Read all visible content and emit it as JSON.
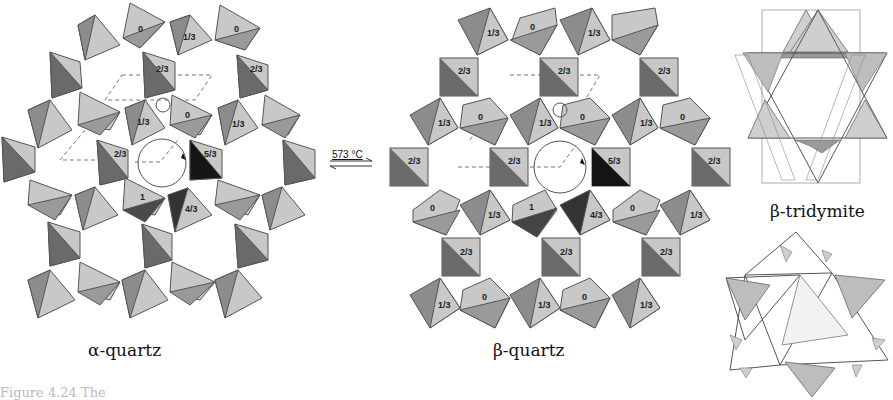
{
  "figure": {
    "panels": [
      {
        "id": "alpha-quartz",
        "caption": "α-quartz"
      },
      {
        "id": "beta-quartz",
        "caption": "β-quartz"
      },
      {
        "id": "beta-tridymite",
        "caption": "β-tridymite"
      }
    ],
    "transition": {
      "label": "573 °C",
      "arrow": "reversible-equilibrium-arrows"
    },
    "colors": {
      "light": "#c8c8c8",
      "mid": "#9a9a9a",
      "dark": "#6a6a6a",
      "black": "#151515",
      "edge": "#555555",
      "dashed": "#777777"
    },
    "alpha_labels": {
      "top": [
        "0",
        "1/3",
        "0"
      ],
      "row2": [
        "2/3",
        "2/3"
      ],
      "row3": [
        "1/3",
        "0",
        "1/3"
      ],
      "center": [
        "2/3",
        "5/3"
      ],
      "row5": [
        "1",
        "4/3"
      ]
    },
    "beta_labels": {
      "rowA": [
        "1/3",
        "0",
        "1/3"
      ],
      "rowB": [
        "2/3",
        "2/3",
        "2/3"
      ],
      "rowC": [
        "1/3",
        "0",
        "1/3",
        "0",
        "1/3",
        "0"
      ],
      "rowD": [
        "2/3",
        "2/3",
        "5/3",
        "2/3"
      ],
      "rowE": [
        "0",
        "1/3",
        "1",
        "4/3",
        "0",
        "1/3"
      ],
      "rowF": [
        "2/3",
        "2/3",
        "2/3"
      ],
      "rowG": [
        "1/3",
        "0",
        "1/3",
        "0",
        "1/3"
      ]
    },
    "footer_partial_text": "Figure 4.24  The"
  }
}
